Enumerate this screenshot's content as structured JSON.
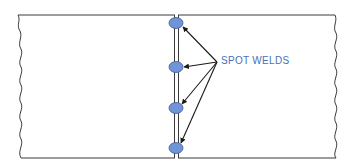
{
  "diagram": {
    "label": "SPOT WELDS",
    "colors": {
      "outline": "#3a3a3a",
      "weld_fill": "#7094d6",
      "weld_stroke": "#3d5a9e",
      "label": "#4a6fb5",
      "arrow": "#1a1a1a",
      "background": "#ffffff"
    },
    "sheets": [
      {
        "name": "left-sheet",
        "x_left": 18,
        "x_right": 175,
        "y_top": 15,
        "y_bottom": 158
      },
      {
        "name": "right-sheet",
        "x_left": 178,
        "x_right": 335,
        "y_top": 15,
        "y_bottom": 158
      }
    ],
    "seam": {
      "x1": 174.5,
      "x2": 178.5,
      "y_top": 15,
      "y_bottom": 158
    },
    "welds": [
      {
        "id": 1,
        "cx": 176,
        "cy": 23,
        "rx": 7,
        "ry": 5.5
      },
      {
        "id": 2,
        "cx": 176,
        "cy": 67,
        "rx": 7,
        "ry": 5.5
      },
      {
        "id": 3,
        "cx": 176,
        "cy": 108,
        "rx": 7,
        "ry": 5.5
      },
      {
        "id": 4,
        "cx": 176,
        "cy": 148,
        "rx": 7,
        "ry": 5.5
      }
    ],
    "arrow_origin": {
      "x": 217,
      "y": 62
    },
    "label_position": {
      "x": 221,
      "y": 55
    }
  }
}
